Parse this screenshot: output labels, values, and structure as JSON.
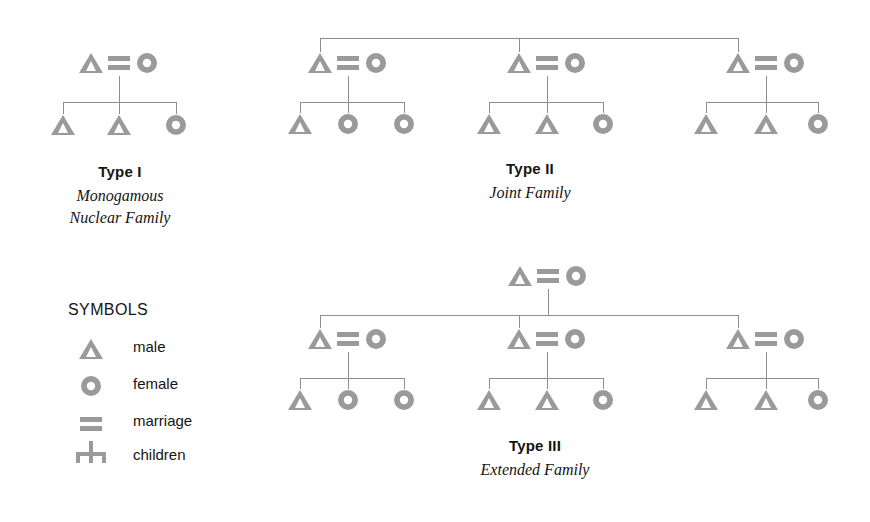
{
  "figure": {
    "background_color": "#ffffff",
    "symbol_color": "#9a9a9a",
    "line_color": "#8e8e8e",
    "text_color": "#141414"
  },
  "legend": {
    "title": "SYMBOLS",
    "items": [
      {
        "icon": "male-triangle-icon",
        "label": "male"
      },
      {
        "icon": "female-circle-icon",
        "label": "female"
      },
      {
        "icon": "marriage-double-bar-icon",
        "label": "marriage"
      },
      {
        "icon": "children-descent-icon",
        "label": "children"
      }
    ]
  },
  "diagrams": [
    {
      "id": "type-1",
      "type_label": "Type I",
      "sub_label_lines": [
        "Monogamous",
        "Nuclear Family"
      ],
      "structure": "one married couple with three children",
      "couples": [
        {
          "husband": "male",
          "wife": "female",
          "children": [
            "male",
            "male",
            "female"
          ]
        }
      ]
    },
    {
      "id": "type-2",
      "type_label": "Type II",
      "sub_label_lines": [
        "Joint Family"
      ],
      "structure": "three sibling married couples joined by a top sibling bar, each with three children",
      "couples": [
        {
          "husband": "male",
          "wife": "female",
          "children": [
            "male",
            "female",
            "female"
          ]
        },
        {
          "husband": "male",
          "wife": "female",
          "children": [
            "male",
            "male",
            "female"
          ]
        },
        {
          "husband": "male",
          "wife": "female",
          "children": [
            "male",
            "male",
            "female"
          ]
        }
      ]
    },
    {
      "id": "type-3",
      "type_label": "Type III",
      "sub_label_lines": [
        "Extended Family"
      ],
      "structure": "senior married couple above three married sons' couples, each with three children",
      "senior_couple": {
        "husband": "male",
        "wife": "female"
      },
      "couples": [
        {
          "husband": "male",
          "wife": "female",
          "children": [
            "male",
            "female",
            "female"
          ]
        },
        {
          "husband": "male",
          "wife": "female",
          "children": [
            "male",
            "male",
            "female"
          ]
        },
        {
          "husband": "male",
          "wife": "female",
          "children": [
            "male",
            "male",
            "female"
          ]
        }
      ]
    }
  ]
}
